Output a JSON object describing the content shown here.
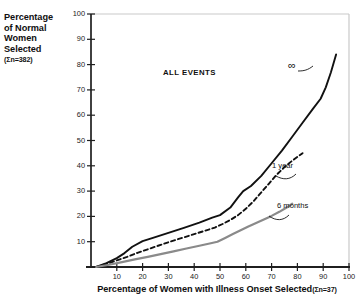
{
  "chart_data": {
    "type": "line",
    "title": "",
    "annotation_title": "ALL EVENTS",
    "xlabel_main": "Percentage of Women with Illness Onset Selected",
    "xlabel_sub": "(Σn=37)",
    "ylabel_main": "Percentage of Normal Women Selected",
    "ylabel_lines": [
      "Percentage",
      "of Normal",
      "Women",
      "Selected"
    ],
    "ylabel_sub": "(Σn=382)",
    "xlim": [
      0,
      100
    ],
    "ylim": [
      0,
      100
    ],
    "xticks": [
      10,
      20,
      30,
      40,
      50,
      60,
      70,
      80,
      90,
      100
    ],
    "yticks": [
      10,
      20,
      30,
      40,
      50,
      60,
      70,
      80,
      90,
      100
    ],
    "grid": false,
    "legend_position": "inline-annotations",
    "series": [
      {
        "name": "∞",
        "label": "∞",
        "style": "solid",
        "color": "#111111",
        "width": 1.9,
        "x": [
          2,
          6,
          10,
          13,
          16,
          20,
          24,
          30,
          36,
          42,
          47,
          50,
          54,
          57,
          59,
          62,
          66,
          70,
          74,
          78,
          82,
          86,
          89,
          91,
          93,
          95
        ],
        "y": [
          0,
          1.5,
          3.5,
          5.5,
          8.0,
          10.2,
          11.5,
          13.5,
          15.5,
          17.5,
          19.5,
          20.5,
          23.5,
          27.5,
          30.0,
          32.0,
          36.0,
          41.0,
          46.0,
          51.5,
          57.0,
          62.5,
          66.5,
          71.0,
          77.0,
          84.0
        ]
      },
      {
        "name": "1 year",
        "label": "1 year",
        "style": "dashed",
        "color": "#111111",
        "width": 1.9,
        "x": [
          2,
          6,
          10,
          14,
          18,
          22,
          26,
          30,
          35,
          40,
          45,
          48,
          51,
          54,
          57,
          60,
          63,
          66,
          69,
          72,
          75,
          78,
          80,
          82
        ],
        "y": [
          0,
          1.2,
          2.6,
          4.0,
          5.6,
          7.0,
          8.4,
          9.8,
          11.4,
          13.0,
          14.6,
          15.6,
          17.0,
          18.6,
          20.5,
          23.0,
          26.0,
          29.5,
          33.0,
          36.5,
          39.5,
          42.0,
          43.5,
          45.0
        ]
      },
      {
        "name": "6 months",
        "label": "6 months",
        "style": "solid",
        "color": "#8a8a8a",
        "width": 2.2,
        "x": [
          2,
          7,
          12,
          17,
          22,
          27,
          32,
          37,
          42,
          46,
          49,
          52,
          55,
          58,
          61,
          64,
          67,
          70,
          73,
          76,
          78
        ],
        "y": [
          0,
          0.9,
          1.9,
          3.0,
          4.0,
          5.1,
          6.2,
          7.3,
          8.4,
          9.3,
          10.0,
          11.5,
          13.0,
          14.5,
          16.0,
          17.4,
          18.8,
          20.2,
          21.8,
          23.6,
          25.0
        ]
      }
    ],
    "axis_color": "#1a1a1a",
    "frame_color": "#c8c8c8"
  }
}
